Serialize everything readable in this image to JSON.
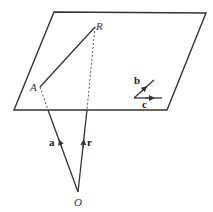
{
  "diagram": {
    "labels": {
      "A": "A",
      "R": "R",
      "O": "O",
      "a": "a",
      "r": "r",
      "b": "b",
      "c": "c"
    },
    "colors": {
      "line": "#333333",
      "plane": "#333333"
    }
  }
}
